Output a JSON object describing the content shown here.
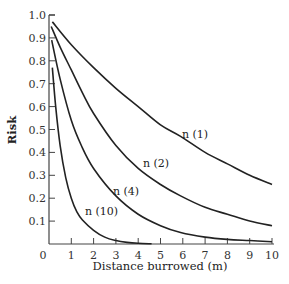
{
  "chart_data": {
    "type": "line",
    "title": "",
    "xlabel": "Distance burrowed (m)",
    "ylabel": "Risk",
    "xlim": [
      0,
      10
    ],
    "ylim": [
      0,
      1.0
    ],
    "grid": false,
    "legend": "inline labels on curves",
    "x_ticks": [
      "0",
      "1",
      "2",
      "3",
      "4",
      "5",
      "6",
      "7",
      "8",
      "9",
      "10"
    ],
    "y_ticks": [
      "0.1",
      "0.2",
      "0.3",
      "0.4",
      "0.5",
      "0.6",
      "0.7",
      "0.8",
      "0.9",
      "1.0"
    ],
    "series": [
      {
        "name": "n (1)",
        "label_pos": [
          182,
          138
        ],
        "x": [
          0.15,
          1,
          2,
          3,
          4,
          5,
          5.9,
          7,
          8,
          9,
          10
        ],
        "y": [
          0.97,
          0.87,
          0.77,
          0.68,
          0.6,
          0.52,
          0.47,
          0.4,
          0.35,
          0.3,
          0.26
        ]
      },
      {
        "name": "n (2)",
        "label_pos": [
          143,
          167
        ],
        "x": [
          0.1,
          0.5,
          1,
          1.5,
          2,
          3,
          4,
          5,
          5.9,
          7,
          8,
          9,
          10
        ],
        "y": [
          0.95,
          0.86,
          0.76,
          0.66,
          0.57,
          0.43,
          0.33,
          0.26,
          0.21,
          0.16,
          0.13,
          0.1,
          0.08
        ]
      },
      {
        "name": "n (4)",
        "label_pos": [
          113,
          195
        ],
        "x": [
          0.12,
          0.5,
          1,
          1.45,
          2,
          3,
          4,
          5,
          5.9,
          7,
          8,
          9,
          10
        ],
        "y": [
          0.89,
          0.72,
          0.54,
          0.43,
          0.33,
          0.21,
          0.13,
          0.08,
          0.05,
          0.03,
          0.02,
          0.015,
          0.01
        ]
      },
      {
        "name": "n (10)",
        "label_pos": [
          85,
          215
        ],
        "x": [
          0.15,
          0.3,
          0.5,
          0.75,
          1,
          1.25,
          1.5,
          2,
          2.5,
          3,
          3.5,
          4,
          4.6
        ],
        "y": [
          0.77,
          0.6,
          0.43,
          0.29,
          0.2,
          0.14,
          0.105,
          0.06,
          0.03,
          0.015,
          0.007,
          0.003,
          0.001
        ]
      }
    ]
  }
}
